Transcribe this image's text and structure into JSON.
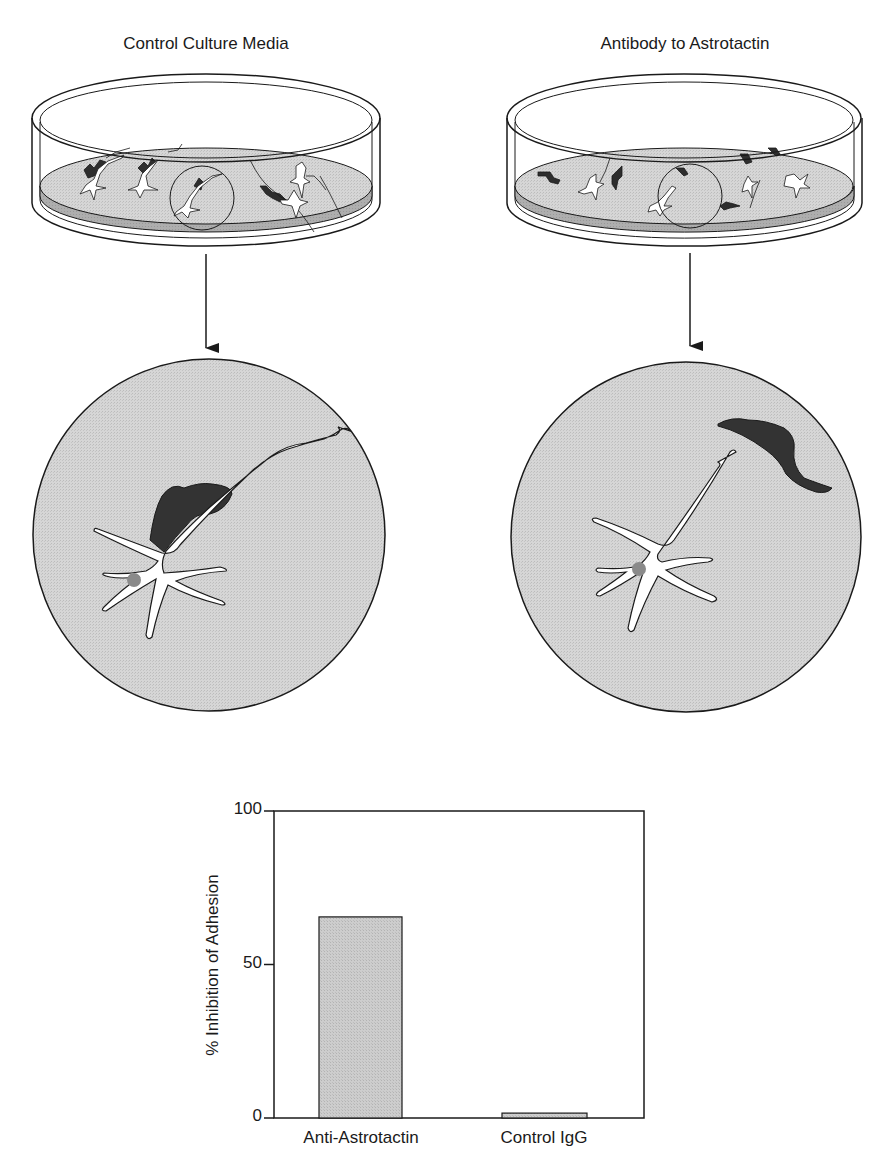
{
  "panels": [
    {
      "title": "Control Culture Media",
      "condition": "control",
      "description": "Neuron process remains in contact with glial cell (adhesion intact)"
    },
    {
      "title": "Antibody to Astrotactin",
      "condition": "anti-astrotactin",
      "description": "Neuron detached from glial cell (adhesion inhibited)"
    }
  ],
  "colors": {
    "medium_fill": "#d4d4d4",
    "medium_edge": "#a8a8a8",
    "glia_fill": "#3a3a3a",
    "neuron_fill": "#ffffff",
    "nucleus_fill": "#8a8a8a",
    "bar_fill": "#c8c8c8",
    "line": "#1a1a1a"
  },
  "chart_data": {
    "type": "bar",
    "title": "",
    "categories": [
      "Anti-Astrotactin",
      "Control IgG"
    ],
    "values": [
      65.5,
      1.6
    ],
    "xlabel": "",
    "ylabel": "% Inhibition of Adhesion",
    "ylim": [
      0,
      100
    ],
    "yticks": [
      0,
      50,
      100
    ],
    "grid": false,
    "legend": null
  },
  "axis": {
    "ytick_labels": [
      "100",
      "50",
      "0"
    ]
  }
}
